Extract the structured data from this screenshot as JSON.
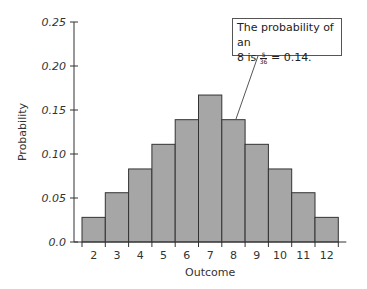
{
  "chart_data": {
    "type": "bar",
    "title": "",
    "xlabel": "Outcome",
    "ylabel": "Probability",
    "categories": [
      "2",
      "3",
      "4",
      "5",
      "6",
      "7",
      "8",
      "9",
      "10",
      "11",
      "12"
    ],
    "values": [
      0.028,
      0.056,
      0.083,
      0.111,
      0.139,
      0.167,
      0.139,
      0.111,
      0.083,
      0.056,
      0.028
    ],
    "ylim": [
      0,
      0.25
    ],
    "yticks": [
      "0.0",
      "0.05",
      "0.10",
      "0.15",
      "0.20",
      "0.25"
    ],
    "grid": false,
    "bar_color": "#a6a6a6",
    "annotation": {
      "line1": "The probability of an",
      "line2_prefix": "8 is ",
      "fraction_num": "5",
      "fraction_den": "36",
      "line2_suffix": " = 0.14.",
      "target_category": "8"
    }
  }
}
